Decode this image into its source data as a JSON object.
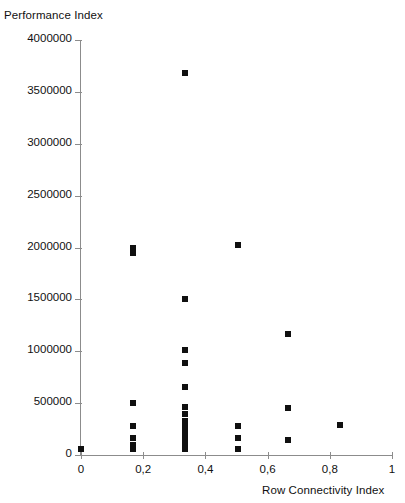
{
  "chart_data": {
    "type": "scatter",
    "title": "",
    "xlabel": "Row Connectivity Index",
    "ylabel": "Performance Index",
    "xlim": [
      0,
      1
    ],
    "ylim": [
      0,
      4000000
    ],
    "grid": false,
    "legend": "none",
    "marker": "filled-square",
    "marker_color": "#101010",
    "axis_color": "#8c8c8c",
    "decimal_separator": ",",
    "xticks": [
      0,
      0.2,
      0.4,
      0.6,
      0.8,
      1
    ],
    "xticklabels": [
      "0",
      "0,2",
      "0,4",
      "0,6",
      "0,8",
      "1"
    ],
    "yticks": [
      0,
      500000,
      1000000,
      1500000,
      2000000,
      2500000,
      3000000,
      3500000,
      4000000
    ],
    "yticklabels": [
      "0",
      "500000",
      "1000000",
      "1500000",
      "2000000",
      "2500000",
      "3000000",
      "3500000",
      "4000000"
    ],
    "points": [
      {
        "x": 0.0,
        "y": 60000
      },
      {
        "x": 0.167,
        "y": 2000000
      },
      {
        "x": 0.167,
        "y": 1945000
      },
      {
        "x": 0.167,
        "y": 505000
      },
      {
        "x": 0.167,
        "y": 275000
      },
      {
        "x": 0.167,
        "y": 165000
      },
      {
        "x": 0.167,
        "y": 100000
      },
      {
        "x": 0.167,
        "y": 55000
      },
      {
        "x": 0.333,
        "y": 3680000
      },
      {
        "x": 0.333,
        "y": 1500000
      },
      {
        "x": 0.333,
        "y": 1010000
      },
      {
        "x": 0.333,
        "y": 890000
      },
      {
        "x": 0.333,
        "y": 660000
      },
      {
        "x": 0.333,
        "y": 460000
      },
      {
        "x": 0.333,
        "y": 400000
      },
      {
        "x": 0.333,
        "y": 330000
      },
      {
        "x": 0.333,
        "y": 270000
      },
      {
        "x": 0.333,
        "y": 215000
      },
      {
        "x": 0.333,
        "y": 160000
      },
      {
        "x": 0.333,
        "y": 110000
      },
      {
        "x": 0.333,
        "y": 60000
      },
      {
        "x": 0.505,
        "y": 2020000
      },
      {
        "x": 0.505,
        "y": 280000
      },
      {
        "x": 0.505,
        "y": 160000
      },
      {
        "x": 0.505,
        "y": 55000
      },
      {
        "x": 0.665,
        "y": 1170000
      },
      {
        "x": 0.665,
        "y": 455000
      },
      {
        "x": 0.665,
        "y": 140000
      },
      {
        "x": 0.833,
        "y": 290000
      }
    ]
  }
}
